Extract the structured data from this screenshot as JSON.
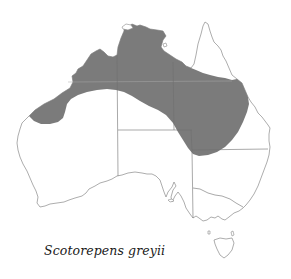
{
  "figure": {
    "type": "species-distribution-map",
    "region": "Australia",
    "caption": "Scotorepens greyii",
    "colors": {
      "background": "#ffffff",
      "distribution_fill": "#7b7b7b",
      "coastline": "#8a8a8a",
      "state_borders": "#6f6f6f"
    },
    "legend": {
      "shaded_area": "distribution range"
    }
  }
}
